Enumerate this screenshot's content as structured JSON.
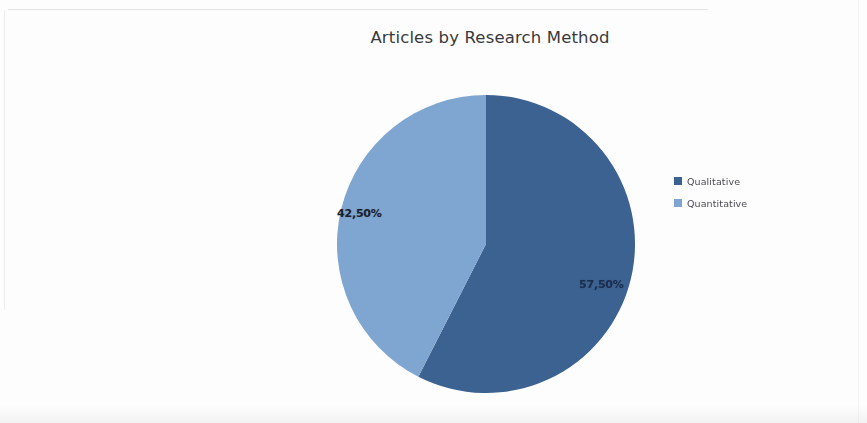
{
  "title": "Articles by Research Method",
  "legend": {
    "position": "right",
    "entries": [
      {
        "label": "Qualitative",
        "color": "#3b6291"
      },
      {
        "label": "Quantitative",
        "color": "#7fa6d0"
      }
    ]
  },
  "labels": {
    "qualitative": "57,50%",
    "quantitative": "42,50%"
  },
  "chart_data": {
    "type": "pie",
    "title": "Articles by Research Method",
    "categories": [
      "Qualitative",
      "Quantitative"
    ],
    "values": [
      57.5,
      42.5
    ],
    "value_labels": [
      "57,50%",
      "42,50%"
    ],
    "colors": [
      "#3b6291",
      "#7fa6d0"
    ],
    "unit": "percent",
    "start_angle_deg": 0,
    "direction": "clockwise",
    "legend": "right",
    "grid": false,
    "xlabel": "",
    "ylabel": ""
  }
}
